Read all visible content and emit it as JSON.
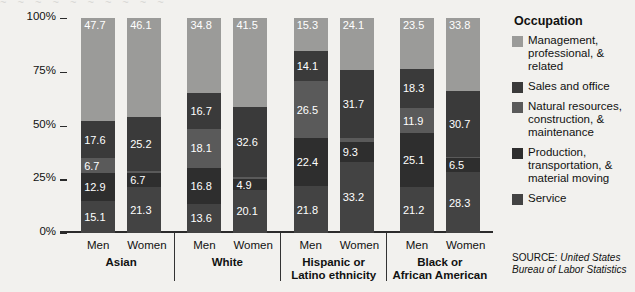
{
  "bleed_text": "~ ~ ~ ~ ~ ~ ~ ~ ~ ~",
  "legend": {
    "title": "Occupation",
    "items": [
      {
        "label": "Management, professional, & related",
        "color": "#9b9b99",
        "key": "management"
      },
      {
        "label": "Sales and office",
        "color": "#3a3a3a",
        "key": "sales"
      },
      {
        "label": "Natural resources, construction, & maintenance",
        "color": "#5a5a5a",
        "key": "natural"
      },
      {
        "label": "Production, transportation, & material moving",
        "color": "#2e2e2e",
        "key": "production"
      },
      {
        "label": "Service",
        "color": "#434343",
        "key": "service"
      }
    ]
  },
  "source": {
    "key": "SOURCE: ",
    "value": "United States Bureau of Labor Statistics"
  },
  "axis": {
    "y_title": "Percent distribution",
    "y_ticks": [
      "100%",
      "75%",
      "50%",
      "25%",
      "0%"
    ]
  },
  "chart_data": {
    "type": "bar",
    "subtype": "stacked-100-percent",
    "title": "",
    "xlabel": "",
    "ylabel": "Percent distribution",
    "ylim": [
      0,
      100
    ],
    "ytick_labels": [
      "0%",
      "25%",
      "50%",
      "75%",
      "100%"
    ],
    "grid": false,
    "legend_position": "right",
    "legend_title": "Occupation",
    "groups": [
      "Asian",
      "White",
      "Hispanic or Latino ethnicity",
      "Black or African American"
    ],
    "categories": [
      "Asian Men",
      "Asian Women",
      "White Men",
      "White Women",
      "Hispanic or Latino ethnicity Men",
      "Hispanic or Latino ethnicity Women",
      "Black or African American Men",
      "Black or African American Women"
    ],
    "series": [
      {
        "name": "Management, professional, & related",
        "color": "#9b9b99",
        "values": [
          47.7,
          46.1,
          34.8,
          41.5,
          15.3,
          24.1,
          23.5,
          33.8
        ]
      },
      {
        "name": "Sales and office",
        "color": "#3a3a3a",
        "values": [
          17.6,
          25.2,
          16.7,
          32.6,
          14.1,
          31.7,
          18.3,
          30.7
        ]
      },
      {
        "name": "Natural resources, construction, & maintenance",
        "color": "#5a5a5a",
        "values": [
          6.7,
          0.7,
          18.1,
          1.0,
          26.5,
          1.7,
          11.9,
          0.7
        ]
      },
      {
        "name": "Production, transportation, & material moving",
        "color": "#2e2e2e",
        "values": [
          12.9,
          6.7,
          16.8,
          4.9,
          22.4,
          9.3,
          25.1,
          6.5
        ]
      },
      {
        "name": "Service",
        "color": "#434343",
        "values": [
          15.1,
          21.3,
          13.6,
          20.1,
          21.8,
          33.2,
          21.2,
          28.3
        ]
      }
    ]
  },
  "bar_groups": [
    {
      "name": "Asian",
      "bars": [
        {
          "gender": "Men",
          "segments": [
            {
              "key": "service",
              "value": 15.1,
              "label": "15.1",
              "color": "#434343"
            },
            {
              "key": "production",
              "value": 12.9,
              "label": "12.9",
              "color": "#2e2e2e"
            },
            {
              "key": "natural",
              "value": 6.7,
              "label": "6.7",
              "color": "#5a5a5a"
            },
            {
              "key": "sales",
              "value": 17.6,
              "label": "17.6",
              "color": "#3a3a3a"
            },
            {
              "key": "management",
              "value": 47.7,
              "label": "47.7",
              "color": "#9b9b99"
            }
          ]
        },
        {
          "gender": "Women",
          "segments": [
            {
              "key": "service",
              "value": 21.3,
              "label": "21.3",
              "color": "#434343"
            },
            {
              "key": "production",
              "value": 6.7,
              "label": "6.7",
              "color": "#2e2e2e"
            },
            {
              "key": "natural",
              "value": 0.7,
              "label": "",
              "color": "#5a5a5a"
            },
            {
              "key": "sales",
              "value": 25.2,
              "label": "25.2",
              "color": "#3a3a3a"
            },
            {
              "key": "management",
              "value": 46.1,
              "label": "46.1",
              "color": "#9b9b99"
            }
          ]
        }
      ]
    },
    {
      "name": "White",
      "bars": [
        {
          "gender": "Men",
          "segments": [
            {
              "key": "service",
              "value": 13.6,
              "label": "13.6",
              "color": "#434343"
            },
            {
              "key": "production",
              "value": 16.8,
              "label": "16.8",
              "color": "#2e2e2e"
            },
            {
              "key": "natural",
              "value": 18.1,
              "label": "18.1",
              "color": "#5a5a5a"
            },
            {
              "key": "sales",
              "value": 16.7,
              "label": "16.7",
              "color": "#3a3a3a"
            },
            {
              "key": "management",
              "value": 34.8,
              "label": "34.8",
              "color": "#9b9b99"
            }
          ]
        },
        {
          "gender": "Women",
          "segments": [
            {
              "key": "service",
              "value": 20.1,
              "label": "20.1",
              "color": "#434343"
            },
            {
              "key": "production",
              "value": 4.9,
              "label": "4.9",
              "color": "#2e2e2e"
            },
            {
              "key": "natural",
              "value": 1.0,
              "label": "",
              "color": "#5a5a5a"
            },
            {
              "key": "sales",
              "value": 32.6,
              "label": "32.6",
              "color": "#3a3a3a"
            },
            {
              "key": "management",
              "value": 41.5,
              "label": "41.5",
              "color": "#9b9b99"
            }
          ]
        }
      ]
    },
    {
      "name": "Hispanic or Latino ethnicity",
      "bars": [
        {
          "gender": "Men",
          "segments": [
            {
              "key": "service",
              "value": 21.8,
              "label": "21.8",
              "color": "#434343"
            },
            {
              "key": "production",
              "value": 22.4,
              "label": "22.4",
              "color": "#2e2e2e"
            },
            {
              "key": "natural",
              "value": 26.5,
              "label": "26.5",
              "color": "#5a5a5a"
            },
            {
              "key": "sales",
              "value": 14.1,
              "label": "14.1",
              "color": "#3a3a3a"
            },
            {
              "key": "management",
              "value": 15.3,
              "label": "15.3",
              "color": "#9b9b99"
            }
          ]
        },
        {
          "gender": "Women",
          "segments": [
            {
              "key": "service",
              "value": 33.2,
              "label": "33.2",
              "color": "#434343"
            },
            {
              "key": "production",
              "value": 9.3,
              "label": "9.3",
              "color": "#2e2e2e"
            },
            {
              "key": "natural",
              "value": 1.7,
              "label": "",
              "color": "#5a5a5a"
            },
            {
              "key": "sales",
              "value": 31.7,
              "label": "31.7",
              "color": "#3a3a3a"
            },
            {
              "key": "management",
              "value": 24.1,
              "label": "24.1",
              "color": "#9b9b99"
            }
          ]
        }
      ]
    },
    {
      "name": "Black or African American",
      "bars": [
        {
          "gender": "Men",
          "segments": [
            {
              "key": "service",
              "value": 21.2,
              "label": "21.2",
              "color": "#434343"
            },
            {
              "key": "production",
              "value": 25.1,
              "label": "25.1",
              "color": "#2e2e2e"
            },
            {
              "key": "natural",
              "value": 11.9,
              "label": "11.9",
              "color": "#5a5a5a"
            },
            {
              "key": "sales",
              "value": 18.3,
              "label": "18.3",
              "color": "#3a3a3a"
            },
            {
              "key": "management",
              "value": 23.5,
              "label": "23.5",
              "color": "#9b9b99"
            }
          ]
        },
        {
          "gender": "Women",
          "segments": [
            {
              "key": "service",
              "value": 28.3,
              "label": "28.3",
              "color": "#434343"
            },
            {
              "key": "production",
              "value": 6.5,
              "label": "6.5",
              "color": "#2e2e2e"
            },
            {
              "key": "natural",
              "value": 0.7,
              "label": "",
              "color": "#5a5a5a"
            },
            {
              "key": "sales",
              "value": 30.7,
              "label": "30.7",
              "color": "#3a3a3a"
            },
            {
              "key": "management",
              "value": 33.8,
              "label": "33.8",
              "color": "#9b9b99"
            }
          ]
        }
      ]
    }
  ],
  "x_axis_groups": [
    {
      "cat_line1": "Asian",
      "cat_line2": "",
      "men": "Men",
      "women": "Women"
    },
    {
      "cat_line1": "White",
      "cat_line2": "",
      "men": "Men",
      "women": "Women"
    },
    {
      "cat_line1": "Hispanic or",
      "cat_line2": "Latino ethnicity",
      "men": "Men",
      "women": "Women"
    },
    {
      "cat_line1": "Black or",
      "cat_line2": "African American",
      "men": "Men",
      "women": "Women"
    }
  ]
}
